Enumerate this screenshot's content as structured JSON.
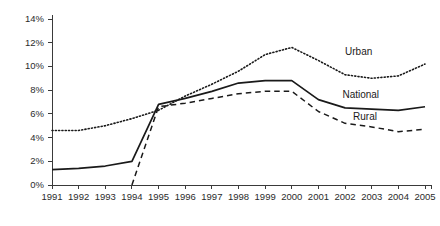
{
  "chart_data": {
    "type": "line",
    "title": "",
    "subtitle": "",
    "xlabel": "",
    "ylabel": "",
    "xlim": [
      1991,
      2005
    ],
    "ylim": [
      0,
      14
    ],
    "grid": false,
    "legend_position": "inline-annotations",
    "x": [
      1991,
      1992,
      1993,
      1994,
      1995,
      1996,
      1997,
      1998,
      1999,
      2000,
      2001,
      2002,
      2003,
      2004,
      2005
    ],
    "x_tick_labels": [
      "1991",
      "1992",
      "1993",
      "1994",
      "1995",
      "1996",
      "1997",
      "1998",
      "1999",
      "2000",
      "2001",
      "2002",
      "2003",
      "2004",
      "2005"
    ],
    "y_tick_values": [
      0,
      2,
      4,
      6,
      8,
      10,
      12,
      14
    ],
    "y_tick_labels": [
      "0%",
      "2%",
      "4%",
      "6%",
      "8%",
      "10%",
      "12%",
      "14%"
    ],
    "series": [
      {
        "name": "Urban",
        "style": "dotted",
        "annotation": "Urban",
        "values": [
          4.6,
          4.6,
          5.0,
          5.6,
          6.3,
          7.5,
          8.5,
          9.6,
          11.0,
          11.6,
          10.5,
          9.3,
          9.0,
          9.2,
          10.2
        ]
      },
      {
        "name": "National",
        "style": "solid",
        "annotation": "National",
        "values": [
          1.3,
          1.4,
          1.6,
          2.0,
          6.8,
          7.3,
          7.9,
          8.6,
          8.8,
          8.8,
          7.2,
          6.5,
          6.4,
          6.3,
          6.6
        ]
      },
      {
        "name": "Rural",
        "style": "dashed",
        "annotation": "Rural",
        "values": [
          null,
          null,
          null,
          0.0,
          6.6,
          6.9,
          7.3,
          7.7,
          7.9,
          7.9,
          6.2,
          5.2,
          4.9,
          4.5,
          4.7
        ]
      }
    ],
    "annotations": [
      {
        "text": "Urban",
        "x": 2002.0,
        "y": 10.95
      },
      {
        "text": "National",
        "x": 2001.9,
        "y": 7.3
      },
      {
        "text": "Rural",
        "x": 2002.3,
        "y": 5.45
      }
    ],
    "colors": {
      "line": "#1a1a1a",
      "axis": "#3a3a3a",
      "text": "#1a1a1a",
      "background": "#ffffff"
    }
  }
}
